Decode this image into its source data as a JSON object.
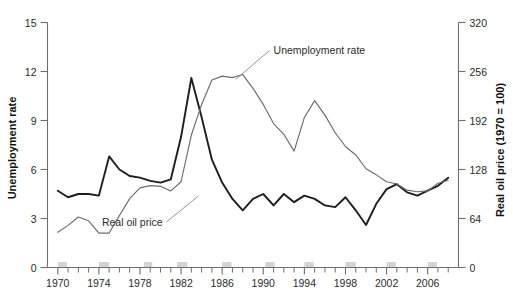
{
  "chart_data": {
    "type": "line",
    "title": "",
    "xlabel": "",
    "ylabel": "Unemployment rate",
    "y2label": "Real oil price (1970 = 100)",
    "grid": false,
    "legend_position": "inline-annotation",
    "xlim": [
      1969,
      2009
    ],
    "ylim": [
      0,
      15
    ],
    "y2lim": [
      0,
      320
    ],
    "x_tick_labels": [
      "1970",
      "1974",
      "1978",
      "1982",
      "1986",
      "1990",
      "1994",
      "1998",
      "2002",
      "2006"
    ],
    "x_tick_values": [
      1970,
      1974,
      1978,
      1982,
      1986,
      1990,
      1994,
      1998,
      2002,
      2006
    ],
    "y_tick_labels": [
      "0",
      "3",
      "6",
      "9",
      "12",
      "15"
    ],
    "y_tick_values": [
      0,
      3,
      6,
      9,
      12,
      15
    ],
    "y2_tick_labels": [
      "0",
      "64",
      "128",
      "192",
      "256",
      "320"
    ],
    "y2_tick_values": [
      0,
      64,
      128,
      192,
      256,
      320
    ],
    "annotations": [
      {
        "text": "Unemployment rate",
        "x": 1991,
        "y": 13.1
      },
      {
        "text": "Real oil price",
        "x": 1980.2,
        "y": 2.55
      }
    ],
    "recession_bands": [
      [
        1970.0,
        1970.9
      ],
      [
        1974.0,
        1975.0
      ],
      [
        1978.4,
        1979.2
      ],
      [
        1981.6,
        1982.6
      ],
      [
        1986.0,
        1986.9
      ],
      [
        1990.2,
        1991.1
      ],
      [
        1994.0,
        1994.9
      ],
      [
        1998.0,
        1999.0
      ],
      [
        2002.0,
        2002.9
      ],
      [
        2006.0,
        2006.9
      ]
    ],
    "x": [
      1970,
      1971,
      1972,
      1973,
      1974,
      1975,
      1976,
      1977,
      1978,
      1979,
      1980,
      1981,
      1982,
      1983,
      1984,
      1985,
      1986,
      1987,
      1988,
      1989,
      1990,
      1991,
      1992,
      1993,
      1994,
      1995,
      1996,
      1997,
      1998,
      1999,
      2000,
      2001,
      2002,
      2003,
      2004,
      2005,
      2006,
      2007,
      2008
    ],
    "series": [
      {
        "name": "Unemployment rate",
        "axis": "left",
        "unit": "percent",
        "color": "#1d1d1d",
        "values": [
          4.7,
          4.3,
          4.5,
          4.5,
          4.4,
          6.8,
          6.0,
          5.6,
          5.5,
          5.3,
          5.2,
          5.4,
          8.0,
          11.6,
          9.2,
          6.6,
          5.2,
          4.2,
          3.5,
          4.2,
          4.5,
          3.8,
          4.5,
          4.0,
          4.4,
          4.2,
          3.8,
          3.7,
          4.3,
          3.5,
          2.6,
          3.9,
          4.8,
          5.1,
          4.6,
          4.4,
          4.7,
          5.0,
          5.5
        ]
      },
      {
        "name": "Real oil price",
        "axis": "right",
        "unit": "index 1970 = 100",
        "color": "#6b6b6b",
        "values": [
          46,
          55,
          66,
          61,
          45,
          45,
          68,
          90,
          104,
          107,
          106,
          100,
          112,
          173,
          213,
          245,
          250,
          248,
          252,
          234,
          213,
          188,
          174,
          152,
          196,
          218,
          199,
          176,
          158,
          147,
          129,
          121,
          112,
          109,
          101,
          99,
          100,
          110,
          114
        ]
      }
    ]
  },
  "axes": {
    "left_title": "Unemployment rate",
    "right_title": "Real oil price (1970 = 100)"
  },
  "labels": {
    "unemployment": "Unemployment rate",
    "oil": "Real oil price"
  }
}
